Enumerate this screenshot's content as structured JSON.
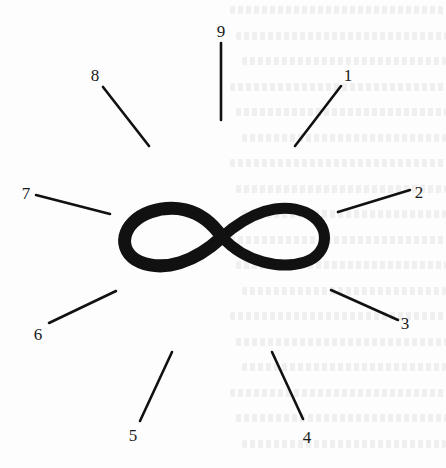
{
  "figure": {
    "center_symbol": "infinity",
    "ink_color": "#111111",
    "background_color": "#fdfdfd",
    "rays": [
      {
        "label": "1",
        "x1": 295,
        "y1": 146,
        "x2": 341,
        "y2": 86,
        "lx": 348,
        "ly": 81
      },
      {
        "label": "2",
        "x1": 338,
        "y1": 212,
        "x2": 410,
        "y2": 190,
        "lx": 419,
        "ly": 198
      },
      {
        "label": "3",
        "x1": 331,
        "y1": 290,
        "x2": 398,
        "y2": 320,
        "lx": 405,
        "ly": 329
      },
      {
        "label": "4",
        "x1": 272,
        "y1": 352,
        "x2": 303,
        "y2": 419,
        "lx": 307,
        "ly": 443
      },
      {
        "label": "5",
        "x1": 172,
        "y1": 352,
        "x2": 140,
        "y2": 421,
        "lx": 133,
        "ly": 441
      },
      {
        "label": "6",
        "x1": 116,
        "y1": 291,
        "x2": 49,
        "y2": 323,
        "lx": 38,
        "ly": 340
      },
      {
        "label": "7",
        "x1": 110,
        "y1": 214,
        "x2": 36,
        "y2": 195,
        "lx": 26,
        "ly": 199
      },
      {
        "label": "8",
        "x1": 149,
        "y1": 146,
        "x2": 103,
        "y2": 87,
        "lx": 95,
        "ly": 81
      },
      {
        "label": "9",
        "x1": 221,
        "y1": 120,
        "x2": 221,
        "y2": 43,
        "lx": 221,
        "ly": 37
      }
    ]
  },
  "bleed_through_text": {
    "legible": false,
    "line_count": 18
  }
}
